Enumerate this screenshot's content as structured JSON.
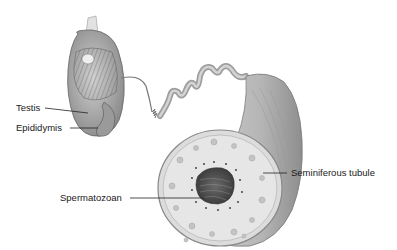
{
  "diagram": {
    "labels": {
      "testis": "Testis",
      "epididymis": "Epididymis",
      "seminiferous_tubule": "Seminiferous tubule",
      "spermatozoan": "Spermatozoan"
    },
    "colors": {
      "background": "#ffffff",
      "tissue_light": "#d8d8d8",
      "tissue_mid": "#a8a8a8",
      "tissue_dark": "#555555",
      "leader_line": "#222222",
      "text": "#1a1a1a"
    }
  }
}
